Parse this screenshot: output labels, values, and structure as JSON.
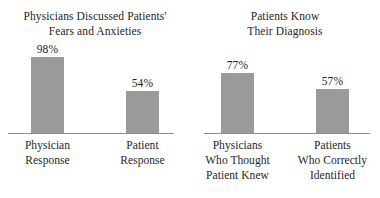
{
  "chart_data": [
    {
      "type": "bar",
      "title": "Physicians Discussed Patients'\nFears and Anxieties",
      "categories": [
        "Physician\nResponse",
        "Patient\nResponse"
      ],
      "values": [
        98,
        54
      ],
      "value_labels": [
        "98%",
        "54%"
      ],
      "xlabel": "",
      "ylabel": "",
      "ylim": [
        0,
        100
      ],
      "grid": false,
      "legend": false,
      "bar_color": "#9a9a9a",
      "axis_color": "#8e8e8e"
    },
    {
      "type": "bar",
      "title": "Patients Know\nTheir Diagnosis",
      "categories": [
        "Physicians\nWho Thought\nPatient Knew",
        "Patients\nWho Correctly\nIdentified"
      ],
      "values": [
        77,
        57
      ],
      "value_labels": [
        "77%",
        "57%"
      ],
      "xlabel": "",
      "ylabel": "",
      "ylim": [
        0,
        100
      ],
      "grid": false,
      "legend": false,
      "bar_color": "#9a9a9a",
      "axis_color": "#8e8e8e"
    }
  ]
}
